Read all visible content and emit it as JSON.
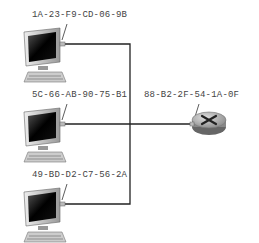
{
  "diagram": {
    "hosts": [
      {
        "mac": "1A-23-F9-CD-06-9B"
      },
      {
        "mac": "5C-66-AB-90-75-B1"
      },
      {
        "mac": "49-BD-D2-C7-56-2A"
      }
    ],
    "router": {
      "mac": "88-B2-2F-54-1A-0F"
    }
  }
}
